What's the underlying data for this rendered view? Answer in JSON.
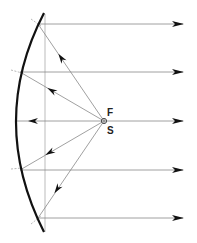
{
  "diagram": {
    "labels": {
      "focus": "F",
      "source": "S"
    },
    "colors": {
      "mirror": "#111111",
      "ray": "#888888",
      "arrow": "#111111",
      "axis": "#aaaaaa"
    },
    "focus_point": {
      "x": 104,
      "y": 121
    },
    "mirror": {
      "top": [
        44,
        13
      ],
      "vertex": [
        16,
        121
      ],
      "bottom": [
        44,
        232
      ]
    },
    "rays": [
      {
        "reflect": [
          38,
          24
        ],
        "out_y": 24
      },
      {
        "reflect": [
          20,
          72
        ],
        "out_y": 72
      },
      {
        "reflect": [
          16,
          121
        ],
        "out_y": 121
      },
      {
        "reflect": [
          20,
          170
        ],
        "out_y": 170
      },
      {
        "reflect": [
          38,
          218
        ],
        "out_y": 218
      }
    ]
  }
}
